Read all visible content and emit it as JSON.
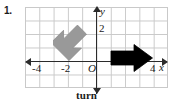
{
  "problem": {
    "number": "1."
  },
  "caption": "turn",
  "colors": {
    "grid_line": "#c9c9c9",
    "axis": "#2b2b2b",
    "preimage_arrow": "#999999",
    "image_arrow": "#000000",
    "text": "#1a1a1a",
    "background": "#ffffff"
  },
  "graph": {
    "axes": {
      "x": {
        "label": "x",
        "arrow_left": "arrow-left",
        "arrow_right": "arrow-right",
        "tick_labels": [
          "-4",
          "-2",
          "4"
        ],
        "range": [
          -5,
          5
        ]
      },
      "y": {
        "label": "y",
        "arrow_up": "arrow-up",
        "arrow_down": "arrow-down",
        "tick_labels": [
          "2"
        ],
        "range": [
          -2,
          4
        ]
      },
      "origin_label": "O"
    },
    "grid": {
      "visible": true,
      "columns": 10,
      "rows": 6,
      "cell_size": 1
    },
    "shapes": [
      {
        "name": "preimage-arrow",
        "color": "#999999",
        "direction": "up-left",
        "description": "gray block arrow pointing up and to the left",
        "approx_center": [
          -1.5,
          1.3
        ]
      },
      {
        "name": "image-arrow",
        "color": "#000000",
        "direction": "right",
        "description": "black block arrow pointing right",
        "approx_center": [
          2.4,
          0.0
        ]
      }
    ]
  }
}
